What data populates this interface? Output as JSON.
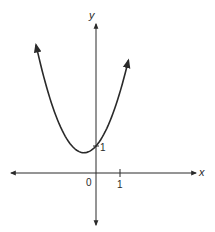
{
  "chart_data": {
    "type": "line",
    "title": "",
    "function": "y = x^2 + x + 1",
    "xlabel": "x",
    "ylabel": "y",
    "origin_label": "0",
    "x_ticks": [
      {
        "value": 1,
        "label": "1"
      }
    ],
    "y_ticks": [
      {
        "value": 1,
        "label": "1"
      }
    ],
    "series": [
      {
        "name": "parabola",
        "points": [
          {
            "x": -2.5,
            "y": 4.75
          },
          {
            "x": -2.0,
            "y": 3.0
          },
          {
            "x": -1.5,
            "y": 1.75
          },
          {
            "x": -1.0,
            "y": 1.0
          },
          {
            "x": -0.5,
            "y": 0.75
          },
          {
            "x": 0.0,
            "y": 1.0
          },
          {
            "x": 0.5,
            "y": 1.75
          },
          {
            "x": 1.0,
            "y": 3.0
          },
          {
            "x": 1.35,
            "y": 4.17
          }
        ]
      }
    ],
    "xlim": [
      -3.6,
      4.2
    ],
    "ylim": [
      -2.2,
      5.8
    ],
    "grid": false,
    "legend": "none",
    "arrows": {
      "curve_ends": true,
      "axes_ends": true
    }
  },
  "labels": {
    "x_axis": "x",
    "y_axis": "y",
    "origin": "0",
    "x_tick_1": "1",
    "y_tick_1": "1"
  },
  "colors": {
    "stroke": "#2a2a2a",
    "background": "#ffffff"
  }
}
